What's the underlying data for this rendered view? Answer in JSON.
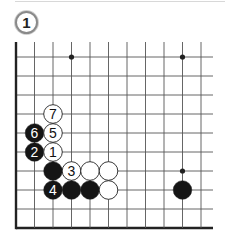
{
  "diagram": {
    "label": "1",
    "board": {
      "columns": 11,
      "rows": 10,
      "origin_x": 16,
      "origin_y": 57,
      "col_spacing": 18.5,
      "row_spacing": 19,
      "top_y": 42,
      "right_x": 213,
      "edges": [
        "left",
        "bottom"
      ],
      "line_color": "#555555",
      "edge_color": "#222222"
    },
    "star_points": [
      {
        "col": 3,
        "row": 0,
        "size": "normal"
      },
      {
        "col": 9,
        "row": 0,
        "size": "normal"
      },
      {
        "col": 9,
        "row": 6,
        "size": "normal"
      }
    ],
    "stones": [
      {
        "color": "white",
        "col": 2,
        "row": 3,
        "label": "7"
      },
      {
        "color": "black",
        "col": 1,
        "row": 4,
        "label": "6"
      },
      {
        "color": "white",
        "col": 2,
        "row": 4,
        "label": "5"
      },
      {
        "color": "black",
        "col": 1,
        "row": 5,
        "label": "2"
      },
      {
        "color": "white",
        "col": 2,
        "row": 5,
        "label": "1"
      },
      {
        "color": "black",
        "col": 2,
        "row": 6,
        "label": ""
      },
      {
        "color": "white",
        "col": 3,
        "row": 6,
        "label": "3"
      },
      {
        "color": "white",
        "col": 4,
        "row": 6,
        "label": ""
      },
      {
        "color": "white",
        "col": 5,
        "row": 6,
        "label": ""
      },
      {
        "color": "black",
        "col": 2,
        "row": 7,
        "label": "4"
      },
      {
        "color": "black",
        "col": 3,
        "row": 7,
        "label": ""
      },
      {
        "color": "black",
        "col": 4,
        "row": 7,
        "label": ""
      },
      {
        "color": "white",
        "col": 5,
        "row": 7,
        "label": ""
      },
      {
        "color": "black",
        "col": 9,
        "row": 7,
        "label": ""
      }
    ]
  }
}
